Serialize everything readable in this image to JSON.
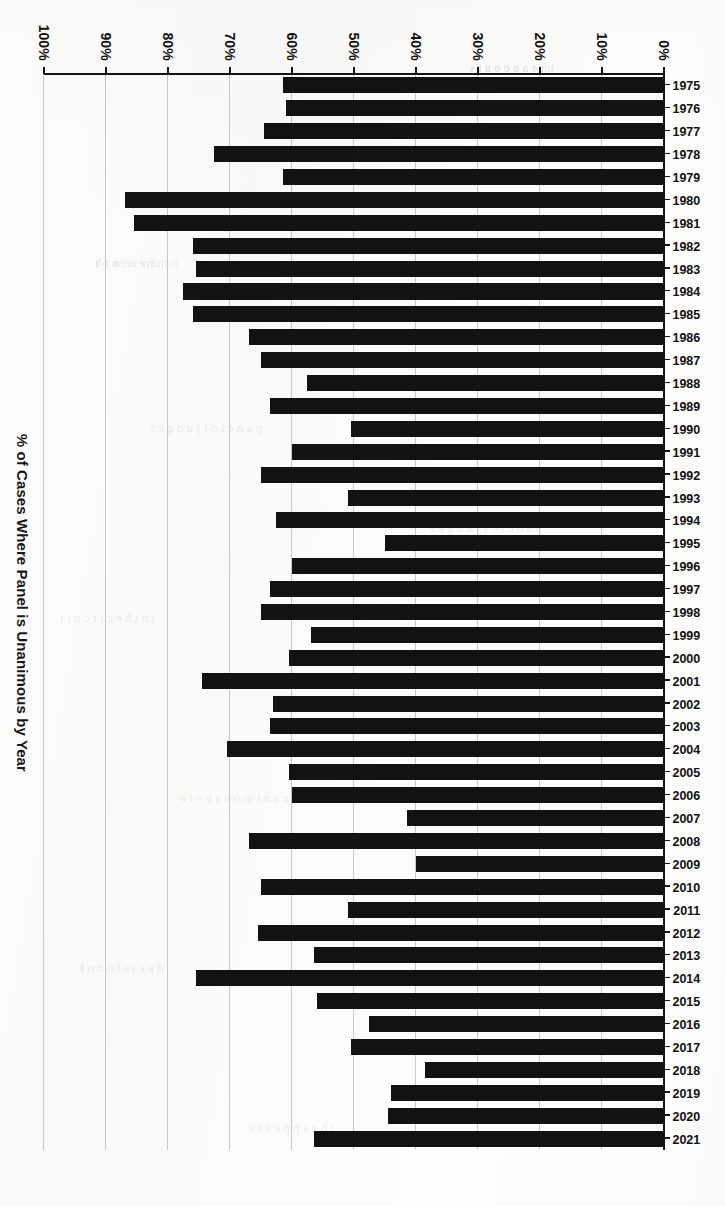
{
  "chart_data": {
    "type": "bar",
    "orientation": "horizontal",
    "title": "% of Cases Where Panel is Unanimous by Year",
    "xlabel": "",
    "ylabel": "% of Cases Where Panel is Unanimous by Year",
    "xlim": [
      0,
      100
    ],
    "ylim": null,
    "grid": true,
    "legend": null,
    "axis_tick_labels": [
      "0%",
      "10%",
      "20%",
      "30%",
      "40%",
      "50%",
      "60%",
      "70%",
      "80%",
      "90%",
      "100%"
    ],
    "axis_tick_values": [
      0,
      10,
      20,
      30,
      40,
      50,
      60,
      70,
      80,
      90,
      100
    ],
    "value_unit": "%",
    "categories": [
      "1975",
      "1976",
      "1977",
      "1978",
      "1979",
      "1980",
      "1981",
      "1982",
      "1983",
      "1984",
      "1985",
      "1986",
      "1987",
      "1988",
      "1989",
      "1990",
      "1991",
      "1992",
      "1993",
      "1994",
      "1995",
      "1996",
      "1997",
      "1998",
      "1999",
      "2000",
      "2001",
      "2002",
      "2003",
      "2004",
      "2005",
      "2006",
      "2007",
      "2008",
      "2009",
      "2010",
      "2011",
      "2012",
      "2013",
      "2014",
      "2015",
      "2016",
      "2017",
      "2018",
      "2019",
      "2020",
      "2021"
    ],
    "values": [
      61.5,
      61.0,
      64.5,
      72.5,
      61.5,
      87.0,
      85.5,
      76.0,
      75.5,
      77.5,
      76.0,
      67.0,
      65.0,
      57.5,
      63.5,
      50.5,
      60.0,
      65.0,
      51.0,
      62.5,
      45.0,
      60.0,
      63.5,
      65.0,
      57.0,
      60.5,
      74.5,
      63.0,
      63.5,
      70.5,
      60.5,
      60.0,
      41.5,
      67.0,
      40.0,
      65.0,
      51.0,
      65.5,
      56.5,
      75.5,
      56.0,
      47.5,
      50.5,
      38.5,
      44.0,
      44.5,
      56.5
    ],
    "bar_color": "#121212",
    "background_color": "#fdfdfb"
  },
  "page": {
    "axis_title": "% of Cases Where Panel is Unanimous by Year",
    "bleed_through": [
      "a s  t h e  c o u r t",
      "r e v i e w  o f",
      "p a n e l  o f  j u d g e s",
      "i n  t h e  c i r c u i t",
      "u n a n i m o u s  v o t e",
      "d e c i s i o n  o f",
      "t h e  a p p e a l s",
      "o f  t h e  n i n t h"
    ]
  }
}
